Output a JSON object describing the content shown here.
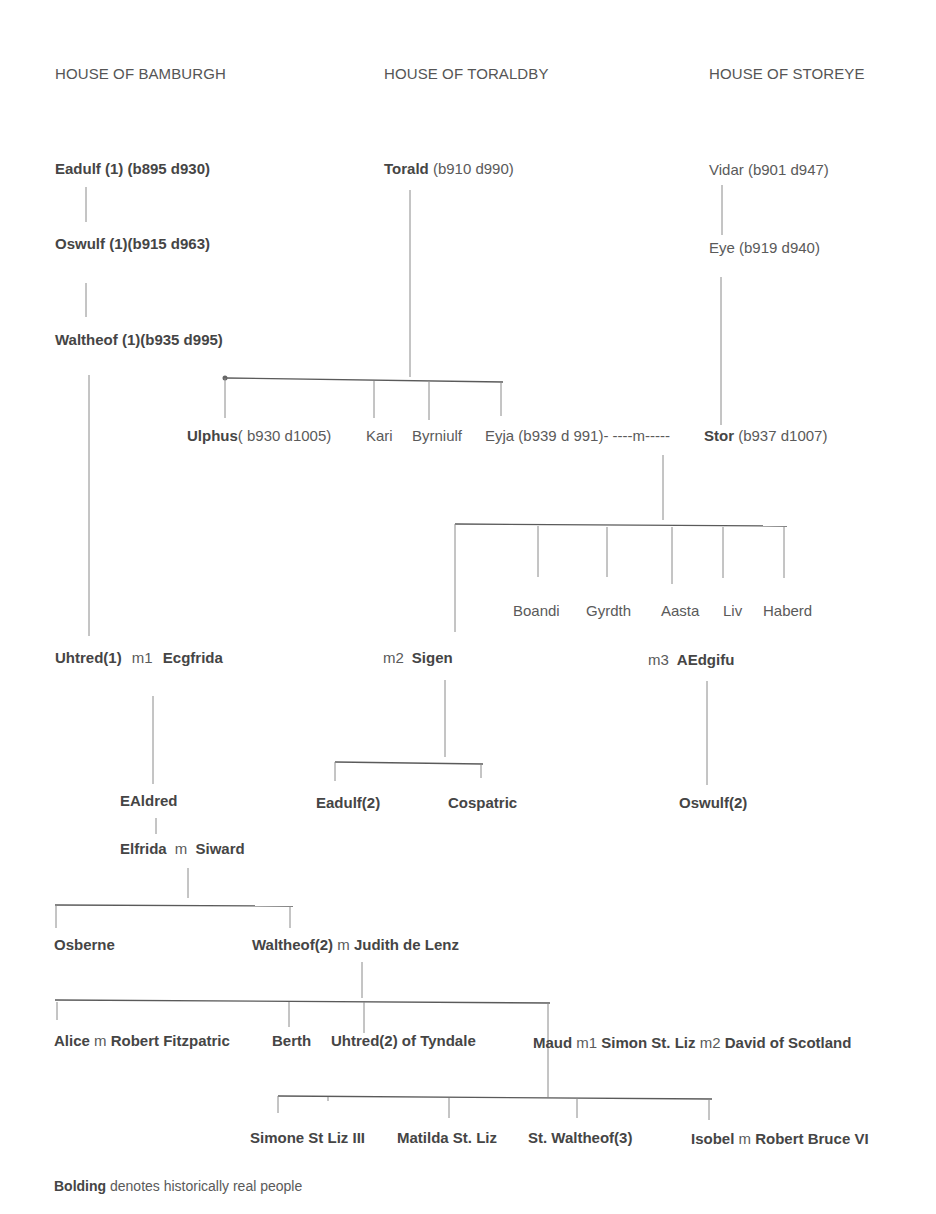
{
  "headers": {
    "bamburgh": "HOUSE  OF BAMBURGH",
    "toraldby": "HOUSE OF TORALDBY",
    "storeye": "HOUSE OF STOREYE"
  },
  "people": {
    "eadulf1": {
      "name": "Eadulf (1) (b895 d930)"
    },
    "oswulf1": {
      "name": "Oswulf (1)(b915 d963)"
    },
    "waltheof1": {
      "name": "Waltheof (1)(b935 d995)"
    },
    "torald": {
      "name": "Torald",
      "dates": " (b910 d990)"
    },
    "vidar": {
      "name": "Vidar (b901 d947)"
    },
    "eye": {
      "name": "Eye (b919 d940)"
    },
    "ulphus": {
      "name": "Ulphus",
      "dates": "( b930 d1005)"
    },
    "kari": {
      "name": "Kari"
    },
    "byrniulf": {
      "name": "Byrniulf"
    },
    "eyja": {
      "name": "Eyja (b939 d 991)- ----m-----"
    },
    "stor": {
      "name": "Stor",
      "dates": " (b937 d1007)"
    },
    "boandi": {
      "name": "Boandi"
    },
    "gyrdth": {
      "name": "Gyrdth"
    },
    "aasta": {
      "name": "Aasta"
    },
    "liv": {
      "name": "Liv"
    },
    "haberd": {
      "name": "Haberd"
    },
    "uhtred1": {
      "name": "Uhtred(1)",
      "marriage": "m1",
      "spouse": "Ecgfrida"
    },
    "sigen": {
      "marriage": "m2",
      "name": "Sigen"
    },
    "aedgifu": {
      "marriage": "m3",
      "name": "AEdgifu"
    },
    "ealdred": {
      "name": "EAldred"
    },
    "eadulf2": {
      "name": "Eadulf(2)"
    },
    "cospatric": {
      "name": "Cospatric"
    },
    "oswulf2": {
      "name": "Oswulf(2)"
    },
    "elfrida": {
      "name": "Elfrida",
      "marriage": "m",
      "spouse": "Siward"
    },
    "osberne": {
      "name": "Osberne"
    },
    "waltheof2": {
      "name": "Waltheof(2)",
      "marriage": "m",
      "spouse": "Judith de Lenz"
    },
    "alice": {
      "name": "Alice",
      "marriage": "m",
      "spouse": "Robert Fitzpatric"
    },
    "berth": {
      "name": "Berth"
    },
    "uhtred2": {
      "name": "Uhtred(2) of Tyndale"
    },
    "maud": {
      "name": "Maud",
      "marriage1": "m1",
      "spouse1": "Simon St. Liz",
      "marriage2": "m2",
      "spouse2": "David of Scotland"
    },
    "simone": {
      "name": "Simone St Liz III"
    },
    "matilda": {
      "name": "Matilda St. Liz"
    },
    "waltheof3": {
      "name": "St. Waltheof(3)"
    },
    "isobel": {
      "name": "Isobel",
      "marriage": "m",
      "spouse": "Robert Bruce VI"
    }
  },
  "legend": {
    "bold_word": "Bolding",
    "rest": " denotes historically real people"
  }
}
